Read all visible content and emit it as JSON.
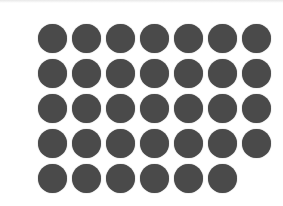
{
  "figure": {
    "type": "dot-array",
    "total_dots": 34,
    "columns": 7,
    "rows": [
      7,
      7,
      7,
      7,
      6
    ],
    "dot_color": "#4a4a4a",
    "background": "#ffffff"
  }
}
